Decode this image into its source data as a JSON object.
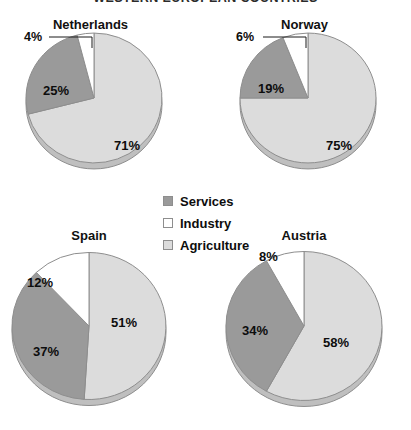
{
  "title": "WESTERN EUROPEAN COUNTRIES",
  "colors": {
    "services": "#9a9a9a",
    "industry": "#ffffff",
    "agriculture": "#dcdcdc",
    "outline": "#8e8e8e",
    "depth_shadow": "#bfbfbf",
    "text": "#0d0d0d",
    "background": "#ffffff"
  },
  "legend": {
    "position": "center",
    "items": [
      {
        "label": "Services",
        "swatch": "#9a9a9a",
        "key": "services"
      },
      {
        "label": "Industry",
        "swatch": "#ffffff",
        "key": "industry"
      },
      {
        "label": "Agriculture",
        "swatch": "#dcdcdc",
        "key": "agriculture"
      }
    ]
  },
  "chart_data": [
    {
      "type": "pie",
      "title": "Netherlands",
      "categories": [
        "Agriculture",
        "Services",
        "Industry"
      ],
      "values": [
        71,
        25,
        4
      ],
      "labels": [
        "71%",
        "25%",
        "4%"
      ],
      "unit": "%",
      "legend_position": "center",
      "callout_slice": "Industry"
    },
    {
      "type": "pie",
      "title": "Norway",
      "categories": [
        "Agriculture",
        "Services",
        "Industry"
      ],
      "values": [
        75,
        19,
        6
      ],
      "labels": [
        "75%",
        "19%",
        "6%"
      ],
      "unit": "%",
      "legend_position": "center",
      "callout_slice": "Industry"
    },
    {
      "type": "pie",
      "title": "Spain",
      "categories": [
        "Agriculture",
        "Services",
        "Industry"
      ],
      "values": [
        51,
        37,
        12
      ],
      "labels": [
        "51%",
        "37%",
        "12%"
      ],
      "unit": "%",
      "legend_position": "center",
      "callout_slice": null
    },
    {
      "type": "pie",
      "title": "Austria",
      "categories": [
        "Agriculture",
        "Services",
        "Industry"
      ],
      "values": [
        58,
        34,
        8
      ],
      "labels": [
        "58%",
        "34%",
        "8%"
      ],
      "unit": "%",
      "legend_position": "center",
      "callout_slice": null
    }
  ],
  "panels": {
    "netherlands": {
      "title": "Netherlands",
      "label_agriculture": "71%",
      "label_services": "25%",
      "label_industry": "4%"
    },
    "norway": {
      "title": "Norway",
      "label_agriculture": "75%",
      "label_services": "19%",
      "label_industry": "6%"
    },
    "spain": {
      "title": "Spain",
      "label_agriculture": "51%",
      "label_services": "37%",
      "label_industry": "12%"
    },
    "austria": {
      "title": "Austria",
      "label_agriculture": "58%",
      "label_services": "34%",
      "label_industry": "8%"
    }
  }
}
